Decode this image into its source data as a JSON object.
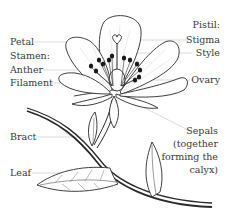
{
  "diagram": {
    "labels": {
      "petal": "Petal",
      "stamen": "Stamen:",
      "anther": "Anther",
      "filament": "Filament",
      "pistil": "Pistil:",
      "stigma": "Stigma",
      "style": "Style",
      "ovary": "Ovary",
      "bract": "Bract",
      "leaf": "Leaf",
      "sepals": [
        "Sepals",
        "(together",
        "forming the",
        "calyx)"
      ]
    },
    "colors": {
      "ink": "#2a2a2a",
      "leader": "#b8b8b8",
      "text": "#3a3a3a"
    }
  }
}
